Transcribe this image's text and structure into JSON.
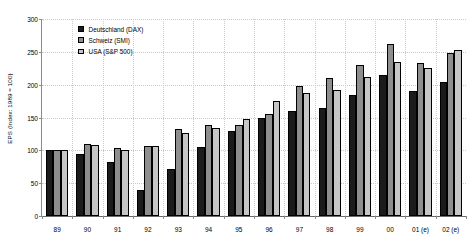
{
  "chart_data": {
    "type": "bar",
    "title": "",
    "subtitle": "",
    "xlabel": "",
    "ylabel": "EPS (Index: 1989 = 100)",
    "categories": [
      "89",
      "90",
      "91",
      "92",
      "93",
      "94",
      "95",
      "96",
      "97",
      "98",
      "99",
      "00",
      "01 (e)",
      "02 (e)"
    ],
    "series": [
      {
        "name": "Deutschland (DAX)",
        "color": "#1b1b1b",
        "values": [
          100,
          95,
          83,
          40,
          71,
          105,
          130,
          150,
          160,
          165,
          185,
          215,
          190,
          204
        ]
      },
      {
        "name": "Schweiz (SMI)",
        "color": "#8e8e8e",
        "values": [
          100,
          110,
          103,
          107,
          132,
          138,
          138,
          155,
          198,
          210,
          230,
          262,
          233,
          248
        ]
      },
      {
        "name": "USA (S&P 500)",
        "color": "#c6c6c6",
        "values": [
          100,
          108,
          100,
          106,
          126,
          134,
          148,
          175,
          187,
          192,
          212,
          235,
          226,
          253
        ]
      }
    ],
    "ylim": [
      0,
      300
    ],
    "yticks": [
      0,
      50,
      100,
      150,
      200,
      250,
      300
    ],
    "ytick_labels": [
      "0",
      "50",
      "100",
      "150",
      "200",
      "250",
      "300"
    ],
    "grid": true,
    "grid_style": "dotted",
    "legend_position": "top-left",
    "legend_entries": [
      "Deutschland (DAX)",
      "Schweiz (SMI)",
      "USA (S&P 500)"
    ]
  }
}
